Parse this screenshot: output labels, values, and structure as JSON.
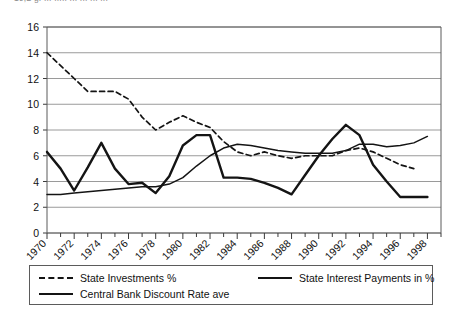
{
  "caption": {
    "clipped_top_text": "19,2  g. ... ..... ... ... ... ..."
  },
  "legend": {
    "items": [
      {
        "label": "State Investments %",
        "style": "dashed",
        "color": "#141414"
      },
      {
        "label": "State Interest Payments in %",
        "style": "solid-thin",
        "color": "#141414"
      },
      {
        "label": "Central Bank Discount Rate ave",
        "style": "solid-thick",
        "color": "#141414"
      }
    ]
  },
  "chart_data": {
    "type": "line",
    "title": "",
    "xlabel": "",
    "ylabel": "",
    "xlim": [
      1970,
      1999
    ],
    "ylim": [
      0,
      16
    ],
    "ytick_step": 2,
    "yticks": [
      0,
      2,
      4,
      6,
      8,
      10,
      12,
      14,
      16
    ],
    "xticks": [
      1970,
      1972,
      1974,
      1976,
      1978,
      1980,
      1982,
      1984,
      1986,
      1988,
      1990,
      1992,
      1994,
      1996,
      1998
    ],
    "xtick_minor_step": 1,
    "grid": "horizontal",
    "legend_position": "bottom",
    "x": [
      1970,
      1971,
      1972,
      1973,
      1974,
      1975,
      1976,
      1977,
      1978,
      1979,
      1980,
      1981,
      1982,
      1983,
      1984,
      1985,
      1986,
      1987,
      1988,
      1989,
      1990,
      1991,
      1992,
      1993,
      1994,
      1995,
      1996,
      1997,
      1998
    ],
    "series": [
      {
        "name": "State Investments %",
        "style": "dashed",
        "color": "#141414",
        "values": [
          14.0,
          13.0,
          12.0,
          11.0,
          11.0,
          11.0,
          10.4,
          9.0,
          8.0,
          8.6,
          9.1,
          8.6,
          8.2,
          7.1,
          6.3,
          6.0,
          6.3,
          6.0,
          5.8,
          6.0,
          6.0,
          6.0,
          6.4,
          6.6,
          6.3,
          5.8,
          5.3,
          5.0,
          null
        ]
      },
      {
        "name": "State Interest Payments in %",
        "style": "solid-thin",
        "color": "#141414",
        "values": [
          3.0,
          3.0,
          3.1,
          3.2,
          3.3,
          3.4,
          3.5,
          3.6,
          3.6,
          3.8,
          4.3,
          5.2,
          6.0,
          6.6,
          6.9,
          6.8,
          6.6,
          6.4,
          6.3,
          6.2,
          6.2,
          6.2,
          6.4,
          6.9,
          6.9,
          6.7,
          6.8,
          7.0,
          7.5
        ]
      },
      {
        "name": "Central Bank Discount Rate ave",
        "style": "solid-thick",
        "color": "#141414",
        "values": [
          6.3,
          5.0,
          3.3,
          5.1,
          7.0,
          5.0,
          3.8,
          3.9,
          3.1,
          4.4,
          6.8,
          7.6,
          7.6,
          4.3,
          4.3,
          4.2,
          3.9,
          3.5,
          3.0,
          4.5,
          6.0,
          7.3,
          8.4,
          7.6,
          5.3,
          4.0,
          2.8,
          2.8,
          2.8
        ]
      }
    ]
  }
}
